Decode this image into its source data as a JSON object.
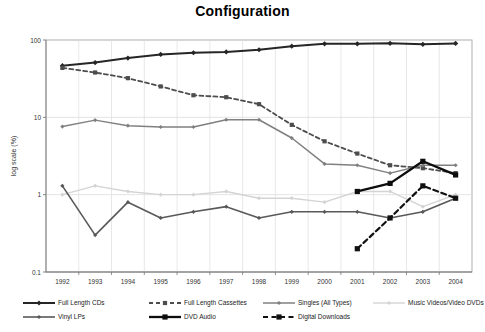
{
  "chart_data": {
    "type": "line",
    "title": "Configuration",
    "xlabel": "",
    "ylabel": "log scale (%)",
    "yscale": "log",
    "ylim": [
      0.1,
      100
    ],
    "ytick_labels": [
      "100",
      "10",
      "1",
      "0.1"
    ],
    "ytick_values": [
      100,
      10,
      1,
      0.1
    ],
    "grid": true,
    "legend_position": "bottom",
    "categories": [
      1992,
      1993,
      1994,
      1995,
      1996,
      1997,
      1998,
      1999,
      2000,
      2001,
      2002,
      2003,
      2004
    ],
    "x": [
      "1992",
      "1993",
      "1994",
      "1995",
      "1996",
      "1997",
      "1998",
      "1999",
      "2000",
      "2001",
      "2002",
      "2003",
      "2004"
    ],
    "series": [
      {
        "name": "Full Length CDs",
        "color": "#262626",
        "style": "solid",
        "width": 2.0,
        "marker": "diamond",
        "values": [
          46.5,
          51.1,
          58.4,
          65.0,
          68.4,
          70.2,
          74.8,
          83.2,
          89.3,
          89.2,
          90.5,
          87.8,
          90.3
        ]
      },
      {
        "name": "Full Length Cassettes",
        "color": "#4d4d4d",
        "style": "dashed",
        "width": 1.8,
        "marker": "square",
        "values": [
          43.6,
          38.0,
          32.1,
          25.1,
          19.3,
          18.2,
          14.8,
          8.0,
          4.9,
          3.4,
          2.4,
          2.2,
          1.9
        ]
      },
      {
        "name": "Singles (All Types)",
        "color": "#808080",
        "style": "solid",
        "width": 1.5,
        "marker": "diamond",
        "values": [
          7.6,
          9.2,
          7.8,
          7.5,
          7.5,
          9.3,
          9.3,
          5.4,
          2.5,
          2.4,
          1.9,
          2.4,
          2.4
        ]
      },
      {
        "name": "Music Videos/Video DVDs",
        "color": "#d4d4d4",
        "style": "solid",
        "width": 1.4,
        "marker": "diamond",
        "values": [
          1.0,
          1.3,
          1.1,
          1.0,
          1.0,
          1.1,
          0.9,
          0.9,
          0.8,
          1.1,
          1.1,
          0.7,
          1.0
        ]
      },
      {
        "name": "Vinyl LPs",
        "color": "#595959",
        "style": "solid",
        "width": 1.6,
        "marker": "diamond",
        "values": [
          1.3,
          0.3,
          0.8,
          0.5,
          0.6,
          0.7,
          0.5,
          0.6,
          0.6,
          0.6,
          0.5,
          0.6,
          0.9
        ]
      },
      {
        "name": "DVD Audio",
        "color": "#0d0d0d",
        "style": "solid",
        "width": 2.3,
        "marker": "square",
        "values": [
          null,
          null,
          null,
          null,
          null,
          null,
          null,
          null,
          null,
          1.1,
          1.4,
          2.7,
          1.8
        ]
      },
      {
        "name": "Digital Downloads",
        "color": "#111111",
        "style": "dashed",
        "width": 2.2,
        "marker": "square",
        "values": [
          null,
          null,
          null,
          null,
          null,
          null,
          null,
          null,
          null,
          0.2,
          0.5,
          1.3,
          0.9
        ]
      }
    ]
  },
  "legend": {
    "rows": [
      [
        {
          "label": "Full Length CDs",
          "key": "Full Length CDs"
        },
        {
          "label": "Full Length Cassettes",
          "key": "Full Length Cassettes"
        },
        {
          "label": "Singles (All Types)",
          "key": "Singles (All Types)"
        },
        {
          "label": "Music Videos/Video DVDs",
          "key": "Music Videos/Video DVDs"
        }
      ],
      [
        {
          "label": "Vinyl LPs",
          "key": "Vinyl LPs"
        },
        {
          "label": "DVD Audio",
          "key": "DVD Audio"
        },
        {
          "label": "Digital Downloads",
          "key": "Digital Downloads"
        }
      ]
    ]
  }
}
